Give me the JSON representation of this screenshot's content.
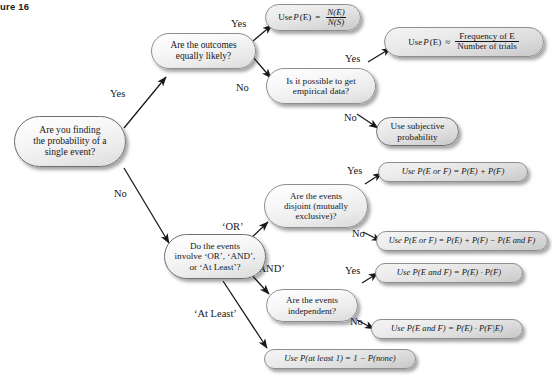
{
  "figure": {
    "label": "gure 16"
  },
  "flowchart": {
    "title": "Probability decision flowchart",
    "nodes": {
      "start": {
        "id": "start",
        "kind": "question",
        "shape": "rounded-pill",
        "shade": "dark",
        "lines": [
          "Are you finding",
          "the probability of a",
          "single event?"
        ]
      },
      "equally_likely": {
        "id": "equally_likely",
        "kind": "question",
        "shape": "rounded-pill",
        "shade": "light",
        "lines": [
          "Are the outcomes",
          "equally likely?"
        ]
      },
      "empirical": {
        "id": "empirical",
        "kind": "question",
        "shape": "rounded-pill",
        "shade": "light",
        "lines": [
          "Is it possible to get",
          "empirical data?"
        ]
      },
      "classical_formula": {
        "id": "classical_formula",
        "kind": "result",
        "shape": "rounded-pill",
        "shade": "light",
        "prefix": "Use ",
        "func": "P",
        "arg": "(E)",
        "relation": "=",
        "numerator": "N(E)",
        "denominator": "N(S)"
      },
      "empirical_formula": {
        "id": "empirical_formula",
        "kind": "result",
        "shape": "rounded-pill",
        "shade": "light",
        "prefix": "Use ",
        "func": "P",
        "arg": "(E)",
        "relation": "≈",
        "numerator": "Frequency of E",
        "denominator": "Number of trials"
      },
      "subjective": {
        "id": "subjective",
        "kind": "result",
        "shape": "rounded-pill",
        "shade": "dark",
        "lines": [
          "Use subjective",
          "probability"
        ]
      },
      "or_and_atleast": {
        "id": "or_and_atleast",
        "kind": "question",
        "shape": "rounded-pill",
        "shade": "dark",
        "lines": [
          "Do the events",
          "involve ‘OR’, ‘AND’,",
          "or ‘At Least’?"
        ]
      },
      "disjoint": {
        "id": "disjoint",
        "kind": "question",
        "shape": "rounded-pill",
        "shade": "light",
        "lines": [
          "Are the events",
          "disjoint (mutually",
          "exclusive)?"
        ]
      },
      "independent": {
        "id": "independent",
        "kind": "question",
        "shape": "rounded-pill",
        "shade": "light",
        "lines": [
          "Are the events",
          "independent?"
        ]
      },
      "add_rule_disjoint": {
        "id": "add_rule_disjoint",
        "kind": "result",
        "shape": "rounded-pill",
        "shade": "light",
        "text": "Use P(E or F) = P(E) + P(F)"
      },
      "add_rule_general": {
        "id": "add_rule_general",
        "kind": "result",
        "shape": "rounded-pill",
        "shade": "light",
        "text": "Use P(E or F) = P(E) + P(F) − P(E and F)"
      },
      "mult_rule_independent": {
        "id": "mult_rule_independent",
        "kind": "result",
        "shape": "rounded-pill",
        "shade": "light",
        "text": "Use P(E and F) = P(E) · P(F)"
      },
      "mult_rule_conditional": {
        "id": "mult_rule_conditional",
        "kind": "result",
        "shape": "rounded-pill",
        "shade": "light",
        "text": "Use P(E and F) = P(E) · P(F|E)"
      },
      "at_least_one": {
        "id": "at_least_one",
        "kind": "result",
        "shape": "rounded-pill",
        "shade": "light",
        "text": "Use P(at least 1) = 1 − P(none)"
      }
    },
    "edge_labels": {
      "start_yes": "Yes",
      "start_no": "No",
      "equally_yes": "Yes",
      "equally_no": "No",
      "empirical_yes": "Yes",
      "empirical_no": "No",
      "branch_or": "‘OR’",
      "branch_and": "‘AND’",
      "branch_at_least": "‘At Least’",
      "disjoint_yes": "Yes",
      "disjoint_no": "No",
      "independent_yes": "Yes",
      "independent_no": "No"
    }
  }
}
